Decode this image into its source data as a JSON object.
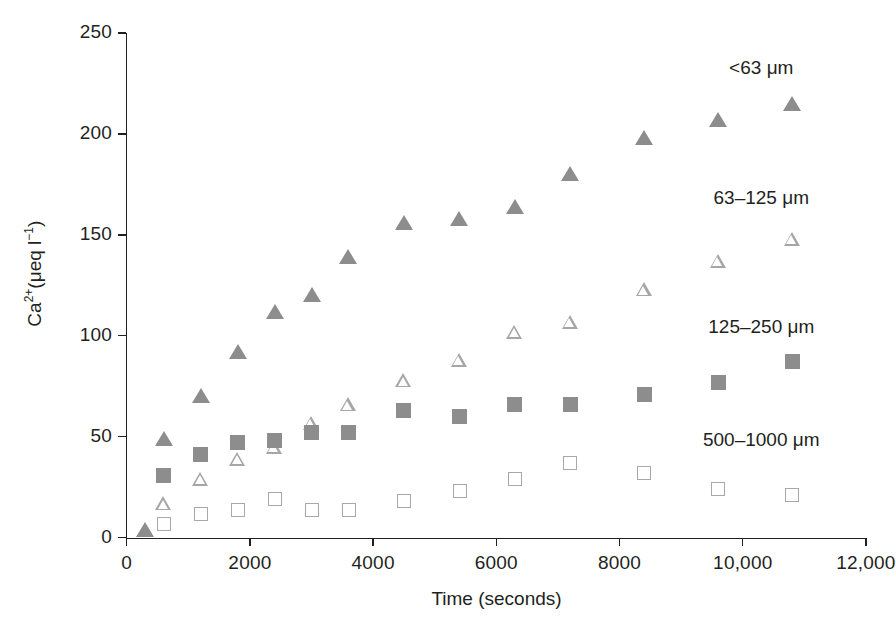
{
  "chart_data": {
    "type": "scatter",
    "title": "",
    "xlabel": "Time (seconds)",
    "ylabel": "Ca2+(μeq l-1)",
    "ylabel_html": "Ca<sup>2+</sup>(μeq l<sup>−1</sup>)",
    "xlim": [
      0,
      12000
    ],
    "ylim": [
      0,
      250
    ],
    "xticks": [
      0,
      2000,
      4000,
      6000,
      8000,
      10000,
      12000
    ],
    "xtick_labels": [
      "0",
      "2000",
      "4000",
      "6000",
      "8000",
      "10,000",
      "12,000"
    ],
    "yticks": [
      0,
      50,
      100,
      150,
      200,
      250
    ],
    "ytick_labels": [
      "0",
      "50",
      "100",
      "150",
      "200",
      "250"
    ],
    "grid": false,
    "legend_position": "right-inline",
    "marker_colors": {
      "filled": "#8d8d8d",
      "open": "#a8a8a8",
      "axis": "#231f20"
    },
    "series": [
      {
        "name": "<63 μm",
        "marker": "filled-triangle",
        "color": "#8d8d8d",
        "label_x": 10300,
        "label_y": 232,
        "points": [
          {
            "x": 300,
            "y": 4
          },
          {
            "x": 600,
            "y": 49
          },
          {
            "x": 1200,
            "y": 70
          },
          {
            "x": 1800,
            "y": 92
          },
          {
            "x": 2400,
            "y": 112
          },
          {
            "x": 3000,
            "y": 120
          },
          {
            "x": 3600,
            "y": 139
          },
          {
            "x": 4500,
            "y": 156
          },
          {
            "x": 5400,
            "y": 158
          },
          {
            "x": 6300,
            "y": 164
          },
          {
            "x": 7200,
            "y": 180
          },
          {
            "x": 8400,
            "y": 198
          },
          {
            "x": 9600,
            "y": 207
          },
          {
            "x": 10800,
            "y": 215
          }
        ]
      },
      {
        "name": "63–125 μm",
        "marker": "open-triangle",
        "color": "#a8a8a8",
        "label_x": 10300,
        "label_y": 168,
        "points": [
          {
            "x": 600,
            "y": 17
          },
          {
            "x": 1200,
            "y": 29
          },
          {
            "x": 1800,
            "y": 39
          },
          {
            "x": 2400,
            "y": 45
          },
          {
            "x": 3000,
            "y": 57
          },
          {
            "x": 3600,
            "y": 66
          },
          {
            "x": 4500,
            "y": 78
          },
          {
            "x": 5400,
            "y": 88
          },
          {
            "x": 6300,
            "y": 102
          },
          {
            "x": 7200,
            "y": 107
          },
          {
            "x": 8400,
            "y": 123
          },
          {
            "x": 9600,
            "y": 137
          },
          {
            "x": 10800,
            "y": 148
          }
        ]
      },
      {
        "name": "125–250 μm",
        "marker": "filled-square",
        "color": "#8d8d8d",
        "label_x": 10300,
        "label_y": 104,
        "points": [
          {
            "x": 600,
            "y": 31
          },
          {
            "x": 1200,
            "y": 41
          },
          {
            "x": 1800,
            "y": 47
          },
          {
            "x": 2400,
            "y": 48
          },
          {
            "x": 3000,
            "y": 52
          },
          {
            "x": 3600,
            "y": 52
          },
          {
            "x": 4500,
            "y": 63
          },
          {
            "x": 5400,
            "y": 60
          },
          {
            "x": 6300,
            "y": 66
          },
          {
            "x": 7200,
            "y": 66
          },
          {
            "x": 8400,
            "y": 71
          },
          {
            "x": 9600,
            "y": 77
          },
          {
            "x": 10800,
            "y": 87
          }
        ]
      },
      {
        "name": "500–1000 μm",
        "marker": "open-square",
        "color": "#a8a8a8",
        "label_x": 10300,
        "label_y": 48,
        "points": [
          {
            "x": 600,
            "y": 7
          },
          {
            "x": 1200,
            "y": 12
          },
          {
            "x": 1800,
            "y": 14
          },
          {
            "x": 2400,
            "y": 19
          },
          {
            "x": 3000,
            "y": 14
          },
          {
            "x": 3600,
            "y": 14
          },
          {
            "x": 4500,
            "y": 18
          },
          {
            "x": 5400,
            "y": 23
          },
          {
            "x": 6300,
            "y": 29
          },
          {
            "x": 7200,
            "y": 37
          },
          {
            "x": 8400,
            "y": 32
          },
          {
            "x": 9600,
            "y": 24
          },
          {
            "x": 10800,
            "y": 21
          }
        ]
      }
    ]
  }
}
